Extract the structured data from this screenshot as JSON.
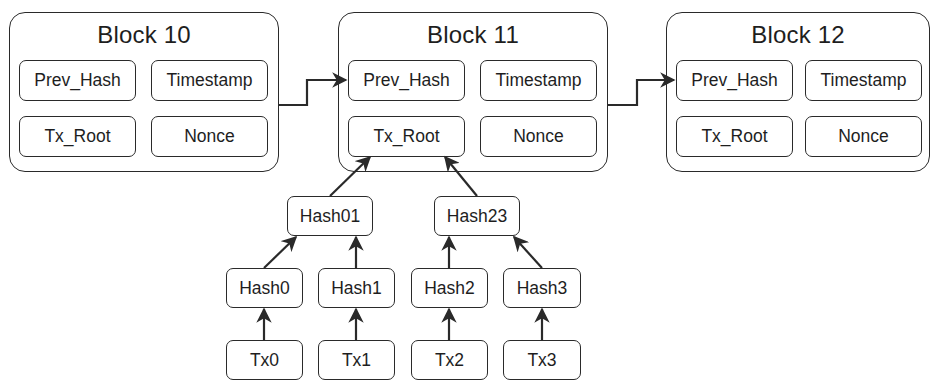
{
  "blocks": [
    {
      "title": "Block 10",
      "fields": {
        "prev_hash": "Prev_Hash",
        "timestamp": "Timestamp",
        "tx_root": "Tx_Root",
        "nonce": "Nonce"
      }
    },
    {
      "title": "Block 11",
      "fields": {
        "prev_hash": "Prev_Hash",
        "timestamp": "Timestamp",
        "tx_root": "Tx_Root",
        "nonce": "Nonce"
      }
    },
    {
      "title": "Block 12",
      "fields": {
        "prev_hash": "Prev_Hash",
        "timestamp": "Timestamp",
        "tx_root": "Tx_Root",
        "nonce": "Nonce"
      }
    }
  ],
  "merkle_tree": {
    "level1": [
      "Hash01",
      "Hash23"
    ],
    "level2": [
      "Hash0",
      "Hash1",
      "Hash2",
      "Hash3"
    ],
    "transactions": [
      "Tx0",
      "Tx1",
      "Tx2",
      "Tx3"
    ]
  },
  "colors": {
    "stroke": "#2a2a2a",
    "background": "#ffffff",
    "text": "#1e1e1e"
  }
}
